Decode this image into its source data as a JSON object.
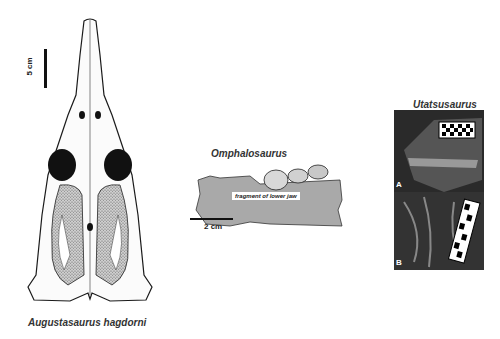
{
  "figure": {
    "panels": [
      {
        "id": "augustasaurus",
        "label": "Augustasaurus hagdorni",
        "scale_bar": "5 cm",
        "type": "skull drawing (dorsal view)"
      },
      {
        "id": "omphalosaurus",
        "label": "Omphalosaurus",
        "scale_bar": "2 cm",
        "inner_label": "fragment of lower jaw",
        "type": "jaw fragment drawing"
      },
      {
        "id": "utatsusaurus",
        "label": "Utatsusaurus",
        "subpanels": [
          "A",
          "B"
        ],
        "type": "fossil photographs"
      }
    ]
  },
  "colors": {
    "fill_gray": "#a9a9a9",
    "ink": "#1a1a1a",
    "photo_dark": "#2a2a2a"
  }
}
